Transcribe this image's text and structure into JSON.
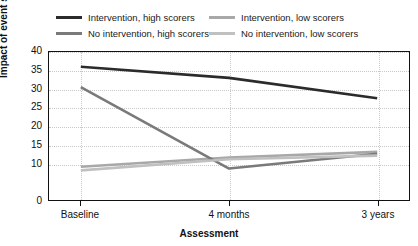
{
  "chart_data": {
    "type": "line",
    "title": "",
    "xlabel": "Assessment",
    "ylabel": "Impact of event scale",
    "categories": [
      "Baseline",
      "4 months",
      "3 years"
    ],
    "ylim": [
      0,
      40
    ],
    "yticks": [
      0,
      10,
      15,
      20,
      25,
      30,
      35,
      40
    ],
    "ytick_labels": [
      "0",
      "10",
      "15",
      "20",
      "25",
      "30",
      "35",
      "40"
    ],
    "grid": true,
    "legend_position": "top",
    "series": [
      {
        "name": "Intervention, high scorers",
        "color": "#2b2b2b",
        "values": [
          36.0,
          33.0,
          27.5
        ]
      },
      {
        "name": "Intervention, low scorers",
        "color": "#a8a8a8",
        "values": [
          9.0,
          11.5,
          13.0
        ]
      },
      {
        "name": "No intervention, high scorers",
        "color": "#7a7a7a",
        "values": [
          30.5,
          8.5,
          12.5
        ]
      },
      {
        "name": "No intervention, low scorers",
        "color": "#c0c0c0",
        "values": [
          8.0,
          11.0,
          12.0
        ]
      }
    ]
  },
  "legend": {
    "items": [
      {
        "label": "Intervention, high scorers",
        "color": "#2b2b2b"
      },
      {
        "label": "Intervention, low scorers",
        "color": "#a8a8a8"
      },
      {
        "label": "No intervention, high scorers",
        "color": "#7a7a7a"
      },
      {
        "label": "No intervention, low scorers",
        "color": "#c0c0c0"
      }
    ]
  },
  "axes": {
    "y_title": "Impact of event scale",
    "x_title": "Assessment"
  }
}
